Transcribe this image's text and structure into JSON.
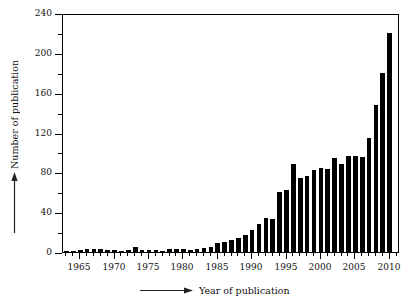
{
  "chart_data": {
    "type": "bar",
    "title": "",
    "subtitle": "",
    "xlabel": "Year of publication",
    "ylabel": "Number of publication",
    "xlim": [
      1962.5,
      2011.5
    ],
    "ylim": [
      0,
      240
    ],
    "grid": false,
    "legend": null,
    "bar_color": "#000000",
    "background_color": "#ffffff",
    "axis_color": "#000000",
    "y_ticks_major": [
      0,
      40,
      80,
      120,
      160,
      200,
      240
    ],
    "y_ticks_minor": [
      20,
      60,
      100,
      140,
      180,
      220
    ],
    "x_ticks_major": [
      1965,
      1970,
      1975,
      1980,
      1985,
      1990,
      1995,
      2000,
      2005,
      2010
    ],
    "categories": [
      1963,
      1964,
      1965,
      1966,
      1967,
      1968,
      1969,
      1970,
      1971,
      1972,
      1973,
      1974,
      1975,
      1976,
      1977,
      1978,
      1979,
      1980,
      1981,
      1982,
      1983,
      1984,
      1985,
      1986,
      1987,
      1988,
      1989,
      1990,
      1991,
      1992,
      1993,
      1994,
      1995,
      1996,
      1997,
      1998,
      1999,
      2000,
      2001,
      2002,
      2003,
      2004,
      2005,
      2006,
      2007,
      2008,
      2009,
      2010
    ],
    "values": [
      1,
      1,
      2,
      3,
      3,
      3,
      2,
      2,
      1,
      2,
      5,
      2,
      2,
      2,
      1,
      3,
      3,
      3,
      2,
      3,
      4,
      5,
      9,
      10,
      12,
      14,
      17,
      22,
      28,
      34,
      33,
      60,
      62,
      88,
      74,
      76,
      82,
      84,
      83,
      94,
      88,
      96,
      96,
      95,
      114,
      148,
      180,
      220
    ]
  },
  "axis_titles": {
    "x": "Year of publication",
    "y": "Number of publication"
  },
  "icons": {
    "x_arrow": "right-arrow-icon",
    "y_arrow": "up-arrow-icon"
  }
}
